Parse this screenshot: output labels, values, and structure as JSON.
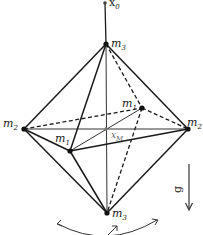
{
  "diagram": {
    "type": "octahedron-pendulum",
    "labels": {
      "pivot": {
        "base": "x",
        "sub": "0"
      },
      "top_vertex": {
        "base": "m",
        "sub": "3"
      },
      "bottom_vertex": {
        "base": "m",
        "sub": "3"
      },
      "left_vertex": {
        "base": "m",
        "sub": "2"
      },
      "right_vertex": {
        "base": "m",
        "sub": "2"
      },
      "front_vertex": {
        "base": "m",
        "sub": "1"
      },
      "back_vertex": {
        "base": "m",
        "sub": "1"
      },
      "center": {
        "base": "x",
        "sub": "M"
      },
      "gravity": "g"
    },
    "colors": {
      "line": "#1a1a1a",
      "center_point": "#777777",
      "background": "#ffffff"
    }
  }
}
